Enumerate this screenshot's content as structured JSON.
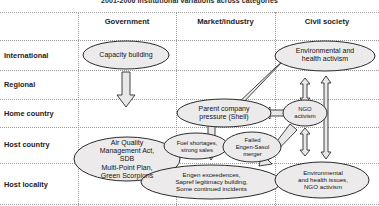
{
  "figure": {
    "title": "2001-2006 Institutional variations across categories"
  },
  "columns": [
    {
      "label": "Government"
    },
    {
      "label": "Market/industry"
    },
    {
      "label": "Civil society"
    }
  ],
  "rows": [
    {
      "label": "International"
    },
    {
      "label": "Regional"
    },
    {
      "label": "Home country"
    },
    {
      "label": "Host country"
    },
    {
      "label": "Host locality"
    }
  ],
  "nodes": [
    {
      "id": "capacity-building",
      "column": "Government",
      "row": "International",
      "lines": [
        "Capacity building"
      ]
    },
    {
      "id": "environmental-health-activism",
      "column": "Civil society",
      "row": "International",
      "lines": [
        "Environmental and",
        "health activism"
      ]
    },
    {
      "id": "parent-company-pressure",
      "column": "Market/industry",
      "row": "Home country",
      "lines": [
        "Parent company",
        "pressure (Shell)"
      ]
    },
    {
      "id": "ngo-activism",
      "column": "Civil society",
      "row": "Home country",
      "lines": [
        "NGO",
        "activism"
      ]
    },
    {
      "id": "air-quality-management",
      "column": "Government",
      "row": "Host country",
      "lines": [
        "Air Quality",
        "Management Act,",
        "SDB",
        "Multi-Point Plan,",
        "Green Scorpions"
      ]
    },
    {
      "id": "fuel-shortages",
      "column": "Market/industry",
      "row": "Host country",
      "lines": [
        "Fuel shortages,",
        "strong sales"
      ]
    },
    {
      "id": "failed-merger",
      "column": "Market/industry",
      "row": "Host country",
      "lines": [
        "Failed",
        "Engen-Sasol",
        "merger"
      ]
    },
    {
      "id": "engen-exceedences",
      "column": "Market/industry",
      "row": "Host locality",
      "lines": [
        "Engen exceedences,",
        "Sapref legitimacy building,",
        "Some continued incidents"
      ]
    },
    {
      "id": "environmental-health-issues",
      "column": "Civil society",
      "row": "Host locality",
      "lines": [
        "Environmental",
        "and health issues,",
        "NGO activism"
      ]
    }
  ],
  "arrows": [
    {
      "id": "capacity-building-down",
      "from": "capacity-building",
      "to": "air-quality-management",
      "direction": "down"
    },
    {
      "id": "activism-to-parent-company",
      "from": "environmental-health-activism",
      "to": "parent-company-pressure",
      "direction": "diagonal-down-left"
    },
    {
      "id": "ngo-to-parent-company",
      "from": "ngo-activism",
      "to": "parent-company-pressure",
      "direction": "left"
    },
    {
      "id": "activism-ngo-link",
      "from": "environmental-health-activism",
      "to": "ngo-activism",
      "direction": "both"
    },
    {
      "id": "ngo-to-issues-link",
      "from": "ngo-activism",
      "to": "environmental-health-issues",
      "direction": "both"
    },
    {
      "id": "activism-to-issues-link",
      "from": "environmental-health-activism",
      "to": "environmental-health-issues",
      "direction": "both"
    },
    {
      "id": "parent-company-down",
      "from": "parent-company-pressure",
      "to": "engen-exceedences",
      "direction": "down"
    },
    {
      "id": "issues-to-merger",
      "from": "environmental-health-issues",
      "to": "failed-merger",
      "direction": "diagonal-up-left"
    }
  ]
}
